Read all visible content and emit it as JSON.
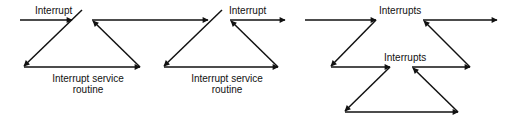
{
  "diagrams": [
    {
      "title": "Single interrupt",
      "labels": {
        "interrupt_1": "Interrupt",
        "isr_1_line1": "Interrupt service",
        "isr_1_line2": "routine",
        "interrupt_2": "Interrupt",
        "isr_2_line1": "Interrupt service",
        "isr_2_line2": "routine"
      }
    },
    {
      "title": "Nested interrupts",
      "labels": {
        "interrupts_1": "Interrupts",
        "interrupts_2": "Interrupts"
      }
    }
  ],
  "colors": {
    "stroke": "#111111",
    "background": "#ffffff"
  }
}
